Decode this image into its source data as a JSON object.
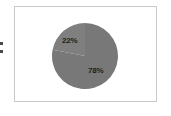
{
  "frame": {
    "border_color": "#c9c9c9",
    "background": "#ffffff"
  },
  "edge_artifact": {
    "description": "cut-off-marks"
  },
  "chart_data": {
    "type": "pie",
    "title": "",
    "subtitle": "",
    "xlabel": "",
    "ylabel": "",
    "categories": [
      "Slice A",
      "Slice B"
    ],
    "values": [
      22,
      78
    ],
    "labels": [
      "22%",
      "78%"
    ],
    "colors": [
      "#7f7f7f",
      "#787878"
    ],
    "start_angle": 0,
    "legend": false,
    "legend_position": "none",
    "grid": false,
    "slices": [
      {
        "label": "22%",
        "value": 22,
        "color": "#7f7f7f",
        "label_position": "upper-left"
      },
      {
        "label": "78%",
        "value": 78,
        "color": "#787878",
        "label_position": "lower-right"
      }
    ]
  }
}
